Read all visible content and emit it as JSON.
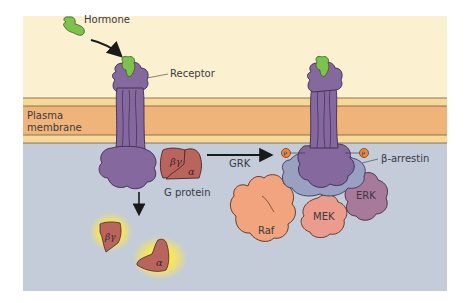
{
  "figure": {
    "title": "",
    "labels": {
      "hormone": "Hormone",
      "receptor": "Receptor",
      "plasma_membrane_line1": "Plasma",
      "plasma_membrane_line2": "membrane",
      "g_protein": "G protein",
      "grk": "GRK",
      "beta_arrestin": "β-arrestin",
      "beta_gamma": "βγ",
      "alpha": "α",
      "raf": "Raf",
      "mek": "MEK",
      "erk": "ERK",
      "phosphate": "P"
    },
    "colors": {
      "extracellular": "#fbf0cf",
      "membrane_outer": "#f6d99a",
      "membrane_core": "#efb47a",
      "membrane_line": "#7a5a3a",
      "cytoplasm": "#c3ccd8",
      "receptor": "#85699e",
      "receptor_dark": "#3d2a52",
      "hormone": "#7dc24c",
      "g_protein": "#b9655d",
      "beta_arrestin": "#9aa0c2",
      "raf": "#f1a47d",
      "mek": "#eb9c8c",
      "erk": "#a7799a",
      "phosphate": "#e8893c",
      "glow": "#ffe84a"
    }
  }
}
